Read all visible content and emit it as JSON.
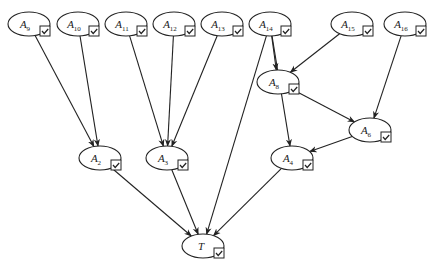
{
  "diagram": {
    "title": "",
    "nodes": [
      {
        "id": "A9",
        "base": "A",
        "sub": "9",
        "cx": 29,
        "cy": 24,
        "checked": true
      },
      {
        "id": "A10",
        "base": "A",
        "sub": "10",
        "cx": 78,
        "cy": 24,
        "checked": true
      },
      {
        "id": "A11",
        "base": "A",
        "sub": "11",
        "cx": 126,
        "cy": 24,
        "checked": true
      },
      {
        "id": "A12",
        "base": "A",
        "sub": "12",
        "cx": 174,
        "cy": 24,
        "checked": true
      },
      {
        "id": "A13",
        "base": "A",
        "sub": "13",
        "cx": 222,
        "cy": 24,
        "checked": true
      },
      {
        "id": "A14",
        "base": "A",
        "sub": "14",
        "cx": 270,
        "cy": 24,
        "checked": true
      },
      {
        "id": "A15",
        "base": "A",
        "sub": "15",
        "cx": 352,
        "cy": 24,
        "checked": true
      },
      {
        "id": "A16",
        "base": "A",
        "sub": "16",
        "cx": 405,
        "cy": 24,
        "checked": true
      },
      {
        "id": "A8",
        "base": "A",
        "sub": "8",
        "cx": 278,
        "cy": 82,
        "checked": true
      },
      {
        "id": "A6",
        "base": "A",
        "sub": "6",
        "cx": 370,
        "cy": 130,
        "checked": true
      },
      {
        "id": "A2",
        "base": "A",
        "sub": "2",
        "cx": 100,
        "cy": 158,
        "checked": true
      },
      {
        "id": "A3",
        "base": "A",
        "sub": "3",
        "cx": 167,
        "cy": 158,
        "checked": true
      },
      {
        "id": "A4",
        "base": "A",
        "sub": "4",
        "cx": 292,
        "cy": 158,
        "checked": true
      },
      {
        "id": "T",
        "base": "T",
        "sub": "",
        "cx": 203,
        "cy": 246,
        "checked": true
      }
    ],
    "edges": [
      {
        "from": "A9",
        "to": "A2"
      },
      {
        "from": "A10",
        "to": "A2"
      },
      {
        "from": "A11",
        "to": "A3"
      },
      {
        "from": "A12",
        "to": "A3"
      },
      {
        "from": "A13",
        "to": "A3"
      },
      {
        "from": "A14",
        "to": "A8"
      },
      {
        "from": "A14",
        "to": "A4"
      },
      {
        "from": "A14",
        "to": "T"
      },
      {
        "from": "A15",
        "to": "A8"
      },
      {
        "from": "A16",
        "to": "A6"
      },
      {
        "from": "A8",
        "to": "A6"
      },
      {
        "from": "A6",
        "to": "A4"
      },
      {
        "from": "A2",
        "to": "T"
      },
      {
        "from": "A3",
        "to": "T"
      },
      {
        "from": "A4",
        "to": "T"
      }
    ],
    "style": {
      "stroke": "#222222",
      "background": "#ffffff"
    }
  }
}
